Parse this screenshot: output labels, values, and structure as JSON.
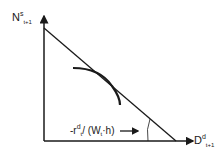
{
  "diagram": {
    "y_axis": {
      "base": "N",
      "sup": "s",
      "sub": "t+1"
    },
    "x_axis": {
      "base": "D",
      "sup": "d",
      "sub": "t+1"
    },
    "slope_label": {
      "prefix": "-r",
      "sup": "d",
      "sub": "t",
      "suffix": "/ (W",
      "sub2": "t",
      "tail": "·h)"
    },
    "colors": {
      "stroke": "#1a1a1a",
      "background": "#ffffff"
    }
  }
}
